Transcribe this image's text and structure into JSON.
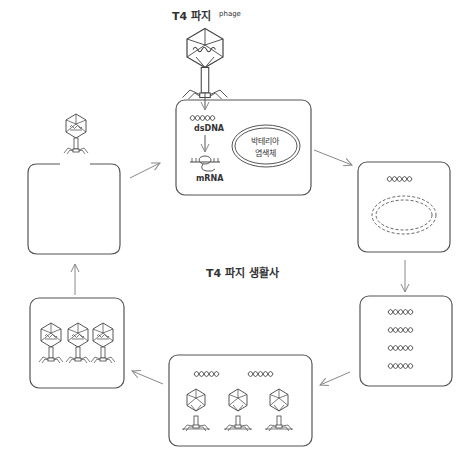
{
  "diagram": {
    "title": "T4 파지 생활사",
    "top_phage_label": "T4 파지",
    "top_phage_sublabel": "phage",
    "stages": [
      {
        "id": "injection",
        "labels": {
          "dsdna": "dsDNA",
          "mrna": "mRNA",
          "chromosome": [
            "박테리아",
            "염색체"
          ]
        }
      },
      {
        "id": "host-chromosome-degraded"
      },
      {
        "id": "dna-replication",
        "dna_copies": 4
      },
      {
        "id": "assembly",
        "dna_copies": 2,
        "heads": 3,
        "tails": 3
      },
      {
        "id": "mature-phages",
        "phages": 3
      },
      {
        "id": "lysis-release"
      }
    ],
    "colors": {
      "stroke": "#555555",
      "arrow": "#888888",
      "text": "#333333"
    }
  }
}
